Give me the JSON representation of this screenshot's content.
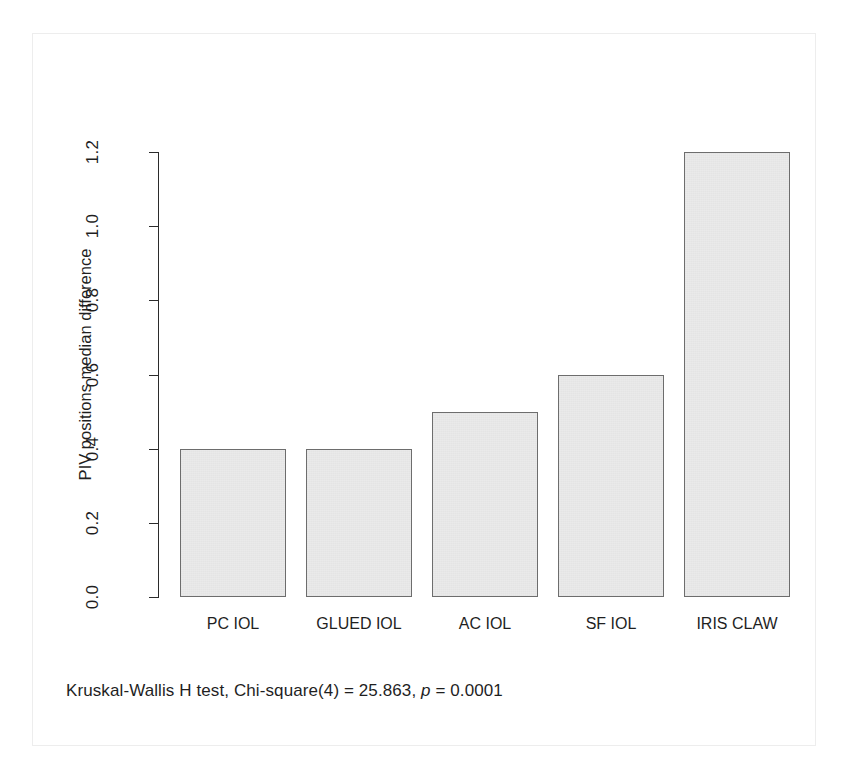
{
  "figure": {
    "y_axis_title": "PIV positions median difference",
    "caption_prefix": "Kruskal-Wallis H test, Chi-square(4) = 25.863, ",
    "caption_p_symbol": "p",
    "caption_suffix": " = 0.0001",
    "bar_fill": "#eaeaea",
    "bar_stroke": "#6d6d6d",
    "axis_color": "#2b2b2b",
    "page_background": "#ffffff"
  },
  "chart_data": {
    "type": "bar",
    "title": "",
    "xlabel": "",
    "ylabel": "PIV positions median difference",
    "categories": [
      "PC IOL",
      "GLUED IOL",
      "AC IOL",
      "SF IOL",
      "IRIS CLAW"
    ],
    "values": [
      0.4,
      0.4,
      0.5,
      0.6,
      1.2
    ],
    "ylim": [
      0.0,
      1.2
    ],
    "yticks": [
      "0.0",
      "0.2",
      "0.4",
      "0.6",
      "0.8",
      "1.0",
      "1.2"
    ],
    "ytick_values": [
      0.0,
      0.2,
      0.4,
      0.6,
      0.8,
      1.0,
      1.2
    ],
    "grid": false,
    "legend": false,
    "annotations": [
      "Kruskal-Wallis H test, Chi-square(4) = 25.863, p = 0.0001"
    ],
    "statistics": {
      "test": "Kruskal-Wallis H test",
      "chi_square_df": 4,
      "chi_square": 25.863,
      "p_value": 0.0001
    }
  }
}
